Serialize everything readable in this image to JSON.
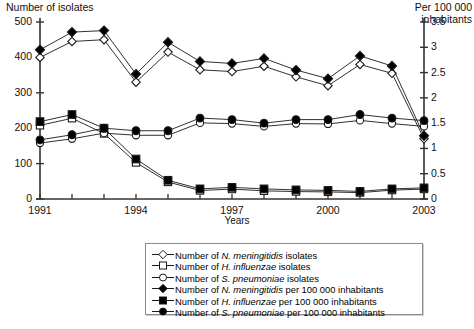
{
  "chart_data": {
    "type": "line",
    "title": "",
    "xlabel": "Years",
    "ylabel": "Number of isolates",
    "y2label": "Per 100 000 inhabitants",
    "x": [
      1991,
      1992,
      1993,
      1994,
      1995,
      1996,
      1997,
      1998,
      1999,
      2000,
      2001,
      2002,
      2003
    ],
    "xtick_labels": [
      "1991",
      "1994",
      "1997",
      "2000",
      "2003"
    ],
    "xticks": [
      1991,
      1994,
      1997,
      2000,
      2003
    ],
    "ylim": [
      0,
      500
    ],
    "ytick_labels": [
      "0",
      "100",
      "200",
      "300",
      "400",
      "500"
    ],
    "yticks": [
      0,
      100,
      200,
      300,
      400,
      500
    ],
    "y2lim": [
      0,
      3.5
    ],
    "y2tick_labels": [
      "0",
      "0.5",
      "1",
      "1.5",
      "2",
      "2.5",
      "3",
      "3.5"
    ],
    "y2ticks": [
      0,
      0.5,
      1,
      1.5,
      2,
      2.5,
      3,
      3.5
    ],
    "grid": false,
    "legend_position": "bottom-center",
    "series": [
      {
        "name": "Number of N. meningitidis isolates",
        "axis": "left",
        "marker": "open-diamond",
        "values": [
          400,
          445,
          450,
          330,
          415,
          365,
          360,
          375,
          345,
          320,
          380,
          355,
          170
        ]
      },
      {
        "name": "Number of H. influenzae isolates",
        "axis": "left",
        "marker": "open-square",
        "values": [
          208,
          228,
          185,
          103,
          48,
          24,
          28,
          23,
          21,
          20,
          18,
          25,
          28
        ]
      },
      {
        "name": "Number of S. pneumoniae isolates",
        "axis": "left",
        "marker": "open-circle",
        "values": [
          158,
          170,
          186,
          180,
          180,
          215,
          213,
          205,
          213,
          212,
          222,
          213,
          205
        ]
      },
      {
        "name": "Number of N. meningitidis per 100 000 inhabitants",
        "axis": "right",
        "marker": "filled-diamond",
        "values": [
          2.95,
          3.3,
          3.33,
          2.47,
          3.1,
          2.72,
          2.68,
          2.78,
          2.55,
          2.38,
          2.83,
          2.63,
          1.25
        ]
      },
      {
        "name": "Number of H. influenzae per 100 000 inhabitants",
        "axis": "right",
        "marker": "filled-square",
        "values": [
          1.53,
          1.67,
          1.4,
          0.79,
          0.37,
          0.2,
          0.23,
          0.2,
          0.18,
          0.17,
          0.15,
          0.2,
          0.22
        ]
      },
      {
        "name": "Number of S. pneumoniae per 100 000 inhabitants",
        "axis": "right",
        "marker": "filled-circle",
        "values": [
          1.17,
          1.27,
          1.4,
          1.35,
          1.35,
          1.6,
          1.57,
          1.5,
          1.57,
          1.57,
          1.67,
          1.6,
          1.55
        ]
      }
    ]
  },
  "axes": {
    "left_title": "Number of isolates",
    "right_title_line1": "Per 100 000",
    "right_title_line2": "inhabitants",
    "x_title": "Years"
  },
  "legend": {
    "items": [
      {
        "marker": "open-diamond",
        "prefix": "Number of ",
        "species": "N. meningitidis",
        "suffix": " isolates"
      },
      {
        "marker": "open-square",
        "prefix": "Number of ",
        "species": "H. influenzae",
        "suffix": " isolates"
      },
      {
        "marker": "open-circle",
        "prefix": "Number of ",
        "species": "S. pneumoniae",
        "suffix": " isolates"
      },
      {
        "marker": "filled-diamond",
        "prefix": "Number of ",
        "species": "N. meningitidis",
        "suffix": " per 100 000 inhabitants"
      },
      {
        "marker": "filled-square",
        "prefix": "Number of ",
        "species": "H. influenzae",
        "suffix": " per 100 000 inhabitants"
      },
      {
        "marker": "filled-circle",
        "prefix": "Number of ",
        "species": "S. pneumoniae",
        "suffix": " per 100 000 inhabitants"
      }
    ]
  },
  "colors": {
    "line": "#1a1a1a",
    "marker_fill_open": "#ffffff",
    "marker_fill_solid": "#000000",
    "axis": "#333333",
    "legend_border": "#8a8a8a"
  }
}
